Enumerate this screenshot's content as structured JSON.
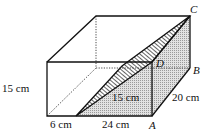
{
  "figure": {
    "type": "cuboid-with-tilted-water-surface",
    "colors": {
      "line": "#111111",
      "shade": "#cfcfcf",
      "hatch": "#111111",
      "background": "#ffffff"
    }
  },
  "labels": {
    "height_left": "15 cm",
    "water_height": "15 cm",
    "depth": "20 cm",
    "bottom_gap": "6 cm",
    "bottom_water": "24 cm"
  },
  "points": {
    "A": "A",
    "B": "B",
    "C": "C",
    "D": "D"
  }
}
